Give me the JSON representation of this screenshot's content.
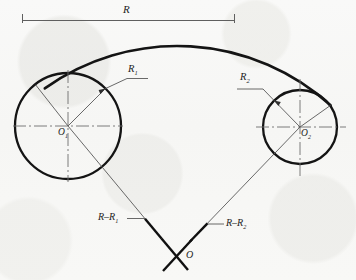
{
  "drawing": {
    "title": "Arc tangent to two circles construction",
    "background_color": "#f8f8f7",
    "ink_color": "#1d1d1d",
    "thin_line_color": "#6a6a6a",
    "labels": {
      "overall_radius": "R",
      "radius_1_main": "R",
      "radius_1_sub": "1",
      "radius_2_main": "R",
      "radius_2_sub": "2",
      "center_1_main": "O",
      "center_1_sub": "1",
      "center_2_main": "O",
      "center_2_sub": "2",
      "construction_1_main": "R–R",
      "construction_1_sub": "1",
      "construction_2_main": "R–R",
      "construction_2_sub": "2",
      "origin": "O"
    },
    "geometry": {
      "dimension_line": {
        "x1": 22,
        "x2": 235,
        "y": 20,
        "tick_top": 14,
        "tick_bottom": 23
      },
      "circle_1": {
        "cx": 68,
        "cy": 126,
        "r": 53
      },
      "circle_2": {
        "cx": 300,
        "cy": 127,
        "r": 37
      },
      "big_arc": {
        "cx": 176,
        "cy": 256,
        "r": 228,
        "start_angle_deg": 208,
        "end_angle_deg": 331
      },
      "origin_point": {
        "x": 176,
        "y": 256
      }
    }
  }
}
